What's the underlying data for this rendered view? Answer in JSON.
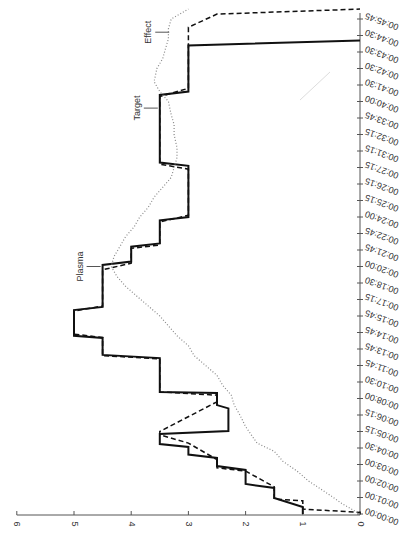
{
  "chart_data": {
    "type": "line",
    "title": "",
    "orientation": "rotated-90-clockwise",
    "xlabel": "Time",
    "ylabel": "",
    "ylim": [
      0,
      6
    ],
    "y_ticks": [
      0,
      1,
      2,
      3,
      4,
      5,
      6
    ],
    "x_tick_labels": [
      "00:00:00",
      "00:01:00",
      "00:02:00",
      "00:03:00",
      "00:04:30",
      "00:05:15",
      "00:06:15",
      "00:08:00",
      "00:10:30",
      "00:11:45",
      "00:13:45",
      "00:14:45",
      "00:15:45",
      "00:17:15",
      "00:18:30",
      "00:20:00",
      "00:21:45",
      "00:22:45",
      "00:24:00",
      "00:25:15",
      "00:26:15",
      "00:27:15",
      "00:31:15",
      "00:32:15",
      "00:33:45",
      "00:40:00",
      "00:41:30",
      "00:42:30",
      "00:43:30",
      "00:44:30",
      "00:45:45"
    ],
    "grid": false,
    "legend": null,
    "annotations": [
      {
        "text": "Plasma",
        "t": 15.0,
        "v": 4.5
      },
      {
        "text": "Target",
        "t": 24.6,
        "v": 3.5
      },
      {
        "text": "Effect",
        "t": 29.2,
        "v": 3.3
      }
    ],
    "series": [
      {
        "name": "Solid (dose/infusion step)",
        "style": "solid",
        "points": [
          [
            0,
            1
          ],
          [
            0.42,
            1
          ],
          [
            0.97,
            1.5
          ],
          [
            1.58,
            1.5
          ],
          [
            1.82,
            2
          ],
          [
            2.67,
            2
          ],
          [
            2.9,
            2.5
          ],
          [
            3.4,
            2.5
          ],
          [
            3.6,
            3
          ],
          [
            4.06,
            3
          ],
          [
            4.24,
            3.5
          ],
          [
            4.85,
            3.5
          ],
          [
            5.03,
            2.3
          ],
          [
            6.4,
            2.3
          ],
          [
            6.6,
            2.5
          ],
          [
            7.33,
            2.5
          ],
          [
            7.4,
            3.5
          ],
          [
            9.45,
            3.5
          ],
          [
            9.64,
            4.5
          ],
          [
            10.67,
            4.5
          ],
          [
            10.8,
            5
          ],
          [
            12.36,
            5
          ],
          [
            12.55,
            4.5
          ],
          [
            15.1,
            4.5
          ],
          [
            15.3,
            4
          ],
          [
            16.2,
            4
          ],
          [
            16.4,
            3.5
          ],
          [
            17.8,
            3.5
          ],
          [
            18.0,
            3
          ],
          [
            21.1,
            3
          ],
          [
            21.3,
            3.5
          ],
          [
            25.4,
            3.5
          ],
          [
            25.6,
            3
          ],
          [
            28.4,
            3
          ],
          [
            28.7,
            0
          ]
        ]
      },
      {
        "name": "Plasma (dashed)",
        "style": "dashed",
        "points": [
          [
            0,
            0
          ],
          [
            0.1,
            0
          ],
          [
            0.3,
            1
          ],
          [
            0.8,
            1
          ],
          [
            0.9,
            1.5
          ],
          [
            1.5,
            1.5
          ],
          [
            1.65,
            1.5
          ],
          [
            2.6,
            2
          ],
          [
            2.8,
            2.5
          ],
          [
            3.3,
            2.5
          ],
          [
            4.3,
            3
          ],
          [
            4.8,
            3.5
          ],
          [
            5.0,
            3.5
          ],
          [
            6.8,
            2.5
          ],
          [
            7.2,
            2.5
          ],
          [
            7.4,
            3.5
          ],
          [
            9.4,
            3.5
          ],
          [
            9.6,
            4.5
          ],
          [
            10.7,
            4.5
          ],
          [
            10.9,
            5
          ],
          [
            12.3,
            5
          ],
          [
            12.6,
            4.5
          ],
          [
            14.8,
            4.5
          ],
          [
            15.2,
            4
          ],
          [
            16.1,
            4
          ],
          [
            16.3,
            3.5
          ],
          [
            17.7,
            3.5
          ],
          [
            18.1,
            3
          ],
          [
            20.9,
            3
          ],
          [
            21.2,
            3.5
          ],
          [
            25.3,
            3.5
          ],
          [
            25.8,
            3
          ],
          [
            28.1,
            3
          ],
          [
            28.8,
            3
          ],
          [
            29.5,
            3
          ],
          [
            30.3,
            2.5
          ],
          [
            30.6,
            0
          ]
        ]
      },
      {
        "name": "Effect (dotted)",
        "style": "dotted",
        "points": [
          [
            0,
            0
          ],
          [
            0.6,
            0.3
          ],
          [
            1.2,
            0.55
          ],
          [
            2.0,
            0.9
          ],
          [
            2.6,
            1.1
          ],
          [
            3.2,
            1.35
          ],
          [
            3.8,
            1.5
          ],
          [
            4.3,
            1.8
          ],
          [
            4.8,
            1.9
          ],
          [
            5.3,
            2.0
          ],
          [
            6.0,
            2.1
          ],
          [
            6.6,
            2.2
          ],
          [
            7.2,
            2.25
          ],
          [
            7.8,
            2.4
          ],
          [
            8.4,
            2.5
          ],
          [
            9.0,
            2.7
          ],
          [
            9.6,
            2.9
          ],
          [
            10.2,
            3.0
          ],
          [
            10.8,
            3.2
          ],
          [
            11.4,
            3.35
          ],
          [
            12.0,
            3.5
          ],
          [
            12.6,
            3.7
          ],
          [
            13.2,
            3.9
          ],
          [
            13.8,
            4.1
          ],
          [
            14.4,
            4.25
          ],
          [
            15.0,
            4.35
          ],
          [
            15.6,
            4.3
          ],
          [
            16.2,
            4.2
          ],
          [
            16.8,
            4.1
          ],
          [
            17.4,
            3.95
          ],
          [
            18.0,
            3.85
          ],
          [
            18.6,
            3.7
          ],
          [
            19.2,
            3.6
          ],
          [
            19.8,
            3.45
          ],
          [
            20.4,
            3.3
          ],
          [
            21.0,
            3.25
          ],
          [
            21.6,
            3.2
          ],
          [
            22.2,
            3.2
          ],
          [
            23.0,
            3.25
          ],
          [
            23.6,
            3.25
          ],
          [
            24.2,
            3.3
          ],
          [
            25.0,
            3.35
          ],
          [
            25.6,
            3.5
          ],
          [
            26.2,
            3.6
          ],
          [
            27.0,
            3.55
          ],
          [
            27.6,
            3.45
          ],
          [
            28.2,
            3.4
          ],
          [
            28.8,
            3.35
          ],
          [
            29.4,
            3.35
          ],
          [
            30.0,
            3.3
          ],
          [
            30.6,
            3.0
          ]
        ]
      }
    ]
  }
}
